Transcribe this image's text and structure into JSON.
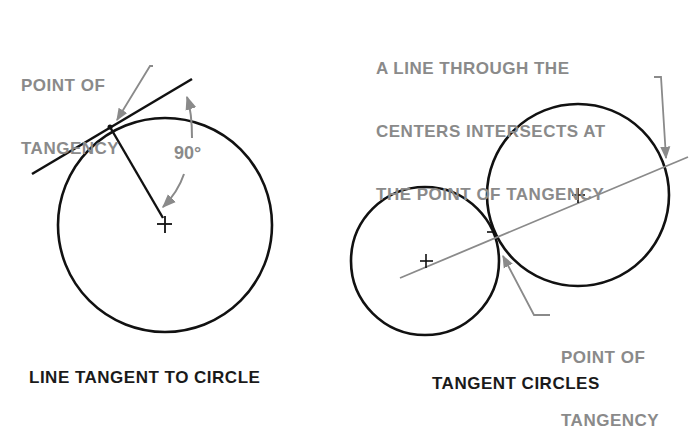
{
  "left_figure": {
    "callout_line1": "POINT OF",
    "callout_line2": "TANGENCY",
    "angle_label": "90°",
    "caption": "LINE TANGENT TO CIRCLE"
  },
  "right_figure": {
    "callout_top_line1": "A LINE THROUGH THE",
    "callout_top_line2": "CENTERS INTERSECTS AT",
    "callout_top_line3": "THE POINT OF TANGENCY",
    "callout_bottom_line1": "POINT OF",
    "callout_bottom_line2": "TANGENCY",
    "caption": "TANGENT CIRCLES"
  },
  "colors": {
    "stroke": "#111111",
    "annotation": "#8a8a8a",
    "background": "#ffffff"
  }
}
